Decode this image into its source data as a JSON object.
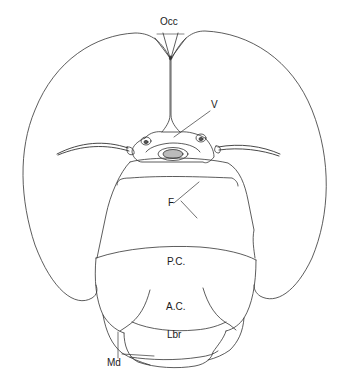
{
  "figure": {
    "type": "anatomical line drawing",
    "stroke_color": "#333333",
    "background": "#ffffff"
  },
  "labels": {
    "occ": "Occ",
    "v": "V",
    "f": "F",
    "pc": "P.C.",
    "ac": "A.C.",
    "lbr": "Lbr",
    "md": "Md"
  }
}
